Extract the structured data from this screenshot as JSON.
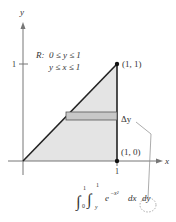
{
  "axes": {
    "x_label": "x",
    "y_label": "y",
    "x_tick": "1",
    "y_tick": "1"
  },
  "region": {
    "label": "R:",
    "condition1": "0 ≤ y ≤ 1",
    "condition2": "y ≤ x ≤ 1",
    "fill_color": "#e4e4e4"
  },
  "points": [
    {
      "label": "(1, 1)"
    },
    {
      "label": "(1, 0)"
    }
  ],
  "strip": {
    "label": "Δy",
    "fill_color": "#c8c8c8"
  },
  "integral": {
    "outer_lower": "0",
    "outer_upper": "1",
    "inner_lower": "y",
    "inner_upper": "1",
    "integrand": "e",
    "exponent": "−x²",
    "dx": "dx",
    "dy": "dy"
  }
}
